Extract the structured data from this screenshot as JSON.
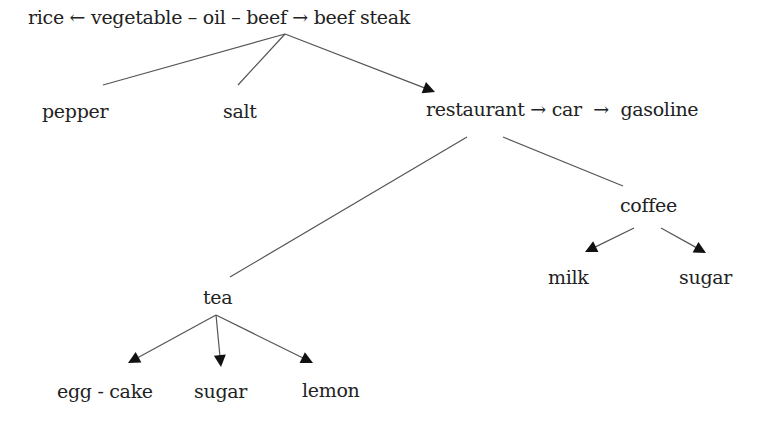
{
  "diagram": {
    "type": "concept-association-tree",
    "colors": {
      "background": "#ffffff",
      "text": "#222222",
      "line": "#555555",
      "arrowhead": "#111111"
    },
    "nodes": [
      {
        "id": "top_chain",
        "label": "rice ← vegetable – oil – beef → beef steak",
        "x": 28,
        "y": 8
      },
      {
        "id": "pepper",
        "label": "pepper",
        "x": 42,
        "y": 102
      },
      {
        "id": "salt",
        "label": "salt",
        "x": 223,
        "y": 102
      },
      {
        "id": "restaurant_chain",
        "label": "restaurant → car  →  gasoline",
        "x": 426,
        "y": 100
      },
      {
        "id": "coffee",
        "label": "coffee",
        "x": 620,
        "y": 196
      },
      {
        "id": "milk",
        "label": "milk",
        "x": 548,
        "y": 268
      },
      {
        "id": "coffee_sugar",
        "label": "sugar",
        "x": 679,
        "y": 268
      },
      {
        "id": "tea",
        "label": "tea",
        "x": 203,
        "y": 288
      },
      {
        "id": "egg_cake",
        "label": "egg - cake",
        "x": 57,
        "y": 382
      },
      {
        "id": "tea_sugar",
        "label": "sugar",
        "x": 194,
        "y": 382
      },
      {
        "id": "lemon",
        "label": "lemon",
        "x": 302,
        "y": 381
      }
    ],
    "edges": [
      {
        "from": "beef",
        "to": "pepper",
        "x1": 285,
        "y1": 34,
        "x2": 103,
        "y2": 85,
        "arrow": false
      },
      {
        "from": "beef",
        "to": "salt",
        "x1": 285,
        "y1": 34,
        "x2": 238,
        "y2": 85,
        "arrow": false
      },
      {
        "from": "beef",
        "to": "restaurant",
        "x1": 285,
        "y1": 34,
        "x2": 435,
        "y2": 92,
        "arrow": true
      },
      {
        "from": "restaurant",
        "to": "tea",
        "x1": 467,
        "y1": 137,
        "x2": 230,
        "y2": 277,
        "arrow": false
      },
      {
        "from": "restaurant",
        "to": "coffee",
        "x1": 503,
        "y1": 137,
        "x2": 623,
        "y2": 186,
        "arrow": false
      },
      {
        "from": "coffee",
        "to": "milk",
        "x1": 634,
        "y1": 228,
        "x2": 585,
        "y2": 252,
        "arrow": true
      },
      {
        "from": "coffee",
        "to": "coffee_sugar",
        "x1": 661,
        "y1": 228,
        "x2": 706,
        "y2": 253,
        "arrow": true
      },
      {
        "from": "tea",
        "to": "egg_cake",
        "x1": 216,
        "y1": 315,
        "x2": 128,
        "y2": 363,
        "arrow": true
      },
      {
        "from": "tea",
        "to": "tea_sugar",
        "x1": 216,
        "y1": 315,
        "x2": 221,
        "y2": 367,
        "arrow": true
      },
      {
        "from": "tea",
        "to": "lemon",
        "x1": 216,
        "y1": 315,
        "x2": 313,
        "y2": 363,
        "arrow": true
      }
    ]
  }
}
